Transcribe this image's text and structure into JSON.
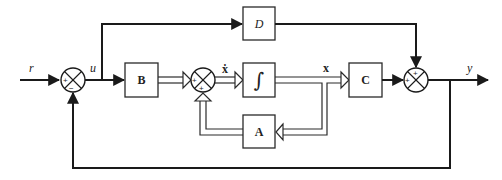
{
  "diagram": {
    "type": "state-space control block diagram",
    "signals": {
      "input": "r",
      "control": "u",
      "state_derivative": "ẋ",
      "state": "x",
      "output": "y"
    },
    "blocks": {
      "B": "B",
      "integrator": "∫",
      "A": "A",
      "C": "C",
      "D": "D"
    },
    "junctions": {
      "input_sum": {
        "top_left": "+",
        "bottom": "−"
      },
      "state_sum": {
        "left": "+",
        "bottom": "+"
      },
      "output_sum": {
        "top": "+",
        "left": "+"
      }
    },
    "colors": {
      "line": "#1a1a1a",
      "background": "#ffffff"
    }
  }
}
